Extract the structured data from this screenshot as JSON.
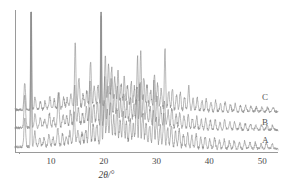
{
  "figure": {
    "kind": "xrd-diffractogram",
    "background_color": "#ffffff",
    "line_color": "#8a8a8a",
    "axis_color": "#9a9a9a",
    "text_color": "#4a4a4a"
  },
  "axis": {
    "x_title": "2θ/°",
    "x_tick_labels": [
      "10",
      "20",
      "30",
      "40",
      "50"
    ],
    "x_tick_values": [
      10,
      20,
      30,
      40,
      50
    ],
    "x_minor_step": 2,
    "y_tick_labels": [],
    "y_axis_visible": true,
    "y_ticks_visible": false
  },
  "traces": [
    {
      "id": "A",
      "label": "A",
      "label_x": 262,
      "label_y": 136
    },
    {
      "id": "B",
      "label": "B",
      "label_x": 262,
      "label_y": 118
    },
    {
      "id": "C",
      "label": "C",
      "label_x": 262,
      "label_y": 93
    }
  ],
  "chart_data": {
    "type": "line",
    "title": "",
    "subtitle": "",
    "xlabel": "2θ/°",
    "ylabel": "",
    "xlim": [
      3.2,
      53.0
    ],
    "ylim": [
      0,
      1
    ],
    "grid": false,
    "legend": "inline-right-of-trace",
    "annotations": [
      "A",
      "B",
      "C"
    ],
    "x_ticks": [
      10,
      20,
      30,
      40,
      50
    ],
    "note": "Stacked powder X-ray diffraction patterns; three offset traces labelled A (bottom), B (middle), C (top). Peak lists below are [2theta_degrees, relative_intensity 0-1].",
    "series": [
      {
        "name": "A",
        "baseline": 0.0,
        "offset": 0.0,
        "peaks": [
          [
            5.05,
            0.2
          ],
          [
            6.25,
            1.0
          ],
          [
            6.95,
            0.1
          ],
          [
            7.9,
            0.06
          ],
          [
            8.7,
            0.05
          ],
          [
            9.6,
            0.07
          ],
          [
            10.4,
            0.05
          ],
          [
            11.3,
            0.12
          ],
          [
            12.2,
            0.07
          ],
          [
            12.9,
            0.05
          ],
          [
            13.6,
            0.09
          ],
          [
            14.4,
            0.21
          ],
          [
            15.1,
            0.1
          ],
          [
            15.9,
            0.07
          ],
          [
            16.6,
            0.09
          ],
          [
            17.3,
            0.24
          ],
          [
            18.0,
            0.12
          ],
          [
            18.7,
            0.13
          ],
          [
            19.5,
            0.95
          ],
          [
            20.1,
            0.3
          ],
          [
            20.7,
            0.22
          ],
          [
            21.3,
            0.28
          ],
          [
            21.9,
            0.18
          ],
          [
            22.5,
            0.24
          ],
          [
            23.1,
            0.15
          ],
          [
            23.7,
            0.2
          ],
          [
            24.3,
            0.14
          ],
          [
            25.0,
            0.17
          ],
          [
            25.6,
            0.13
          ],
          [
            26.2,
            0.3
          ],
          [
            26.8,
            0.4
          ],
          [
            27.4,
            0.22
          ],
          [
            28.0,
            0.16
          ],
          [
            28.7,
            0.13
          ],
          [
            29.4,
            0.24
          ],
          [
            30.0,
            0.18
          ],
          [
            30.7,
            0.14
          ],
          [
            31.4,
            0.22
          ],
          [
            32.1,
            0.12
          ],
          [
            32.8,
            0.15
          ],
          [
            33.6,
            0.1
          ],
          [
            34.3,
            0.12
          ],
          [
            35.1,
            0.09
          ],
          [
            35.9,
            0.1
          ],
          [
            36.7,
            0.08
          ],
          [
            37.5,
            0.09
          ],
          [
            38.4,
            0.07
          ],
          [
            39.2,
            0.08
          ],
          [
            40.1,
            0.06
          ],
          [
            41.0,
            0.07
          ],
          [
            41.9,
            0.05
          ],
          [
            42.8,
            0.06
          ],
          [
            43.8,
            0.05
          ],
          [
            44.7,
            0.05
          ],
          [
            45.7,
            0.04
          ],
          [
            46.7,
            0.05
          ],
          [
            47.7,
            0.04
          ],
          [
            48.7,
            0.04
          ],
          [
            49.8,
            0.03
          ],
          [
            50.8,
            0.04
          ],
          [
            51.9,
            0.03
          ]
        ]
      },
      {
        "name": "B",
        "baseline": 0.0,
        "offset": 0.0,
        "peaks": [
          [
            5.05,
            0.22
          ],
          [
            6.25,
            1.0
          ],
          [
            7.0,
            0.09
          ],
          [
            8.0,
            0.06
          ],
          [
            8.8,
            0.05
          ],
          [
            9.7,
            0.09
          ],
          [
            10.5,
            0.06
          ],
          [
            11.4,
            0.22
          ],
          [
            12.3,
            0.08
          ],
          [
            13.0,
            0.06
          ],
          [
            13.7,
            0.1
          ],
          [
            14.5,
            0.26
          ],
          [
            15.2,
            0.12
          ],
          [
            16.0,
            0.08
          ],
          [
            16.7,
            0.11
          ],
          [
            17.4,
            0.28
          ],
          [
            18.1,
            0.14
          ],
          [
            18.8,
            0.15
          ],
          [
            19.5,
            0.72
          ],
          [
            20.2,
            0.33
          ],
          [
            20.8,
            0.26
          ],
          [
            21.4,
            0.3
          ],
          [
            22.0,
            0.2
          ],
          [
            22.6,
            0.25
          ],
          [
            23.2,
            0.16
          ],
          [
            23.8,
            0.21
          ],
          [
            24.4,
            0.15
          ],
          [
            25.1,
            0.18
          ],
          [
            25.7,
            0.14
          ],
          [
            26.3,
            0.26
          ],
          [
            26.9,
            0.31
          ],
          [
            27.5,
            0.2
          ],
          [
            28.1,
            0.15
          ],
          [
            28.8,
            0.13
          ],
          [
            29.5,
            0.32
          ],
          [
            30.1,
            0.2
          ],
          [
            30.8,
            0.13
          ],
          [
            31.5,
            0.17
          ],
          [
            32.2,
            0.11
          ],
          [
            32.9,
            0.13
          ],
          [
            33.7,
            0.09
          ],
          [
            34.4,
            0.11
          ],
          [
            35.2,
            0.08
          ],
          [
            36.0,
            0.09
          ],
          [
            36.8,
            0.07
          ],
          [
            37.6,
            0.08
          ],
          [
            38.5,
            0.06
          ],
          [
            39.3,
            0.07
          ],
          [
            40.2,
            0.06
          ],
          [
            41.1,
            0.07
          ],
          [
            42.0,
            0.05
          ],
          [
            42.9,
            0.06
          ],
          [
            43.9,
            0.05
          ],
          [
            44.8,
            0.05
          ],
          [
            45.8,
            0.04
          ],
          [
            46.8,
            0.04
          ],
          [
            47.8,
            0.04
          ],
          [
            48.8,
            0.03
          ],
          [
            49.9,
            0.03
          ],
          [
            50.9,
            0.03
          ],
          [
            52.0,
            0.03
          ]
        ]
      },
      {
        "name": "C",
        "baseline": 0.0,
        "offset": 0.0,
        "peaks": [
          [
            5.05,
            0.18
          ],
          [
            6.25,
            0.96
          ],
          [
            7.0,
            0.08
          ],
          [
            8.0,
            0.05
          ],
          [
            8.9,
            0.05
          ],
          [
            9.8,
            0.08
          ],
          [
            10.6,
            0.06
          ],
          [
            11.5,
            0.1
          ],
          [
            12.4,
            0.07
          ],
          [
            13.1,
            0.06
          ],
          [
            13.8,
            0.09
          ],
          [
            14.6,
            0.45
          ],
          [
            15.3,
            0.2
          ],
          [
            16.1,
            0.08
          ],
          [
            16.8,
            0.1
          ],
          [
            17.5,
            0.3
          ],
          [
            18.2,
            0.13
          ],
          [
            18.9,
            0.14
          ],
          [
            19.5,
            1.0
          ],
          [
            20.3,
            0.35
          ],
          [
            20.9,
            0.28
          ],
          [
            21.5,
            0.26
          ],
          [
            22.1,
            0.19
          ],
          [
            22.7,
            0.23
          ],
          [
            23.3,
            0.15
          ],
          [
            23.9,
            0.2
          ],
          [
            24.5,
            0.14
          ],
          [
            25.2,
            0.17
          ],
          [
            25.8,
            0.13
          ],
          [
            26.4,
            0.34
          ],
          [
            27.0,
            0.38
          ],
          [
            27.6,
            0.21
          ],
          [
            28.2,
            0.15
          ],
          [
            28.9,
            0.12
          ],
          [
            29.6,
            0.22
          ],
          [
            30.2,
            0.17
          ],
          [
            30.9,
            0.13
          ],
          [
            31.6,
            0.42
          ],
          [
            32.3,
            0.12
          ],
          [
            33.0,
            0.14
          ],
          [
            33.8,
            0.1
          ],
          [
            34.5,
            0.12
          ],
          [
            35.3,
            0.09
          ],
          [
            36.1,
            0.16
          ],
          [
            36.9,
            0.08
          ],
          [
            37.7,
            0.09
          ],
          [
            38.6,
            0.07
          ],
          [
            39.4,
            0.08
          ],
          [
            40.3,
            0.06
          ],
          [
            41.2,
            0.07
          ],
          [
            42.1,
            0.05
          ],
          [
            43.0,
            0.06
          ],
          [
            44.0,
            0.05
          ],
          [
            44.9,
            0.05
          ],
          [
            45.9,
            0.04
          ],
          [
            46.9,
            0.04
          ],
          [
            47.9,
            0.04
          ],
          [
            48.9,
            0.03
          ],
          [
            50.0,
            0.03
          ],
          [
            51.0,
            0.03
          ],
          [
            52.1,
            0.03
          ]
        ]
      }
    ]
  }
}
